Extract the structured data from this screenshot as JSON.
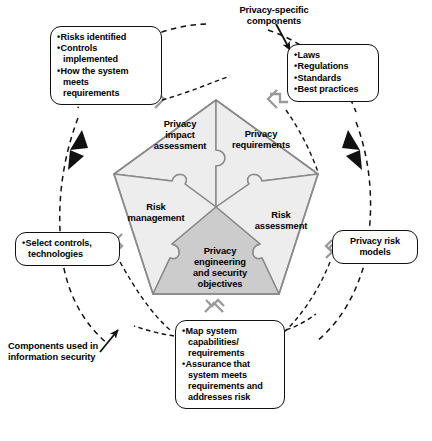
{
  "figure": {
    "type": "pentagon puzzle diagram"
  },
  "colors": {
    "outer_segment_fill": "#ededed",
    "core_triangle_fill": "#cccccc",
    "segment_stroke": "#8a8a8a",
    "connector_gray": "#9a9a9a",
    "ink": "#000000",
    "background": "#ffffff"
  },
  "center": {
    "core_label": "Privacy\nengineering\nand security\nobjectives",
    "segments": [
      {
        "id": "privacy-impact-assessment",
        "label": "Privacy\nimpact\nassessment"
      },
      {
        "id": "privacy-requirements",
        "label": "Privacy\nrequirements"
      },
      {
        "id": "risk-assessment",
        "label": "Risk\nassessment"
      },
      {
        "id": "risk-management",
        "label": "Risk\nmanagement"
      }
    ]
  },
  "annotations": {
    "privacy_specific": "Privacy-specific\ncomponents",
    "infosec_components": "Components used in\ninformation security"
  },
  "callouts": {
    "assessment_results": {
      "id": "assessment-results",
      "items": [
        "Risks identified",
        "Controls\nimplemented",
        "How the system\nmeets\nrequirements"
      ]
    },
    "privacy_sources": {
      "id": "privacy-sources",
      "items": [
        "Laws",
        "Regulations",
        "Standards",
        "Best practices"
      ]
    },
    "controls_technologies": {
      "id": "controls-technologies",
      "items": [
        "Select controls,\ntechnologies"
      ]
    },
    "privacy_risk_models": {
      "id": "privacy-risk-models",
      "text": "Privacy risk\nmodels"
    },
    "system_mapping": {
      "id": "system-mapping",
      "items": [
        "Map system\ncapabilities/\nrequirements",
        "Assurance that\nsystem meets\nrequirements and\naddresses risk"
      ]
    }
  }
}
